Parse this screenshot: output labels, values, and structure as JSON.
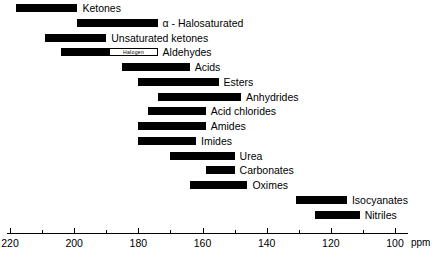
{
  "chart_data": {
    "type": "bar",
    "title": "",
    "xlabel": "ppm",
    "ylabel": "",
    "orientation": "horizontal-range",
    "axis": {
      "unit": "ppm",
      "min": 100,
      "max": 220,
      "reversed": true,
      "major_ticks": [
        220,
        200,
        180,
        160,
        140,
        120,
        100
      ],
      "minor_ticks": [
        210,
        190,
        170,
        150,
        130,
        110
      ],
      "tick_labels": [
        "220",
        "200",
        "180",
        "160",
        "140",
        "120",
        "100"
      ],
      "grid": false
    },
    "legend": "none",
    "categories": [
      "Ketones",
      "α - Halosaturated",
      "Unsaturated ketones",
      "Aldehydes",
      "Acids",
      "Esters",
      "Anhydrides",
      "Acid chlorides",
      "Amides",
      "Imides",
      "Urea",
      "Carbonates",
      "Oximes",
      "Isocyanates",
      "Nitriles"
    ],
    "ranges": [
      {
        "label": "Ketones",
        "start_ppm": 218,
        "end_ppm": 199
      },
      {
        "label": "α - Halosaturated",
        "start_ppm": 199,
        "end_ppm": 174
      },
      {
        "label": "Unsaturated ketones",
        "start_ppm": 209,
        "end_ppm": 190
      },
      {
        "label": "Aldehydes",
        "start_ppm": 204,
        "end_ppm": 174,
        "split_at_ppm": 189,
        "split_label": "Halogen"
      },
      {
        "label": "Acids",
        "start_ppm": 185,
        "end_ppm": 164
      },
      {
        "label": "Esters",
        "start_ppm": 180,
        "end_ppm": 155
      },
      {
        "label": "Anhydrides",
        "start_ppm": 174,
        "end_ppm": 148
      },
      {
        "label": "Acid chlorides",
        "start_ppm": 177,
        "end_ppm": 159
      },
      {
        "label": "Amides",
        "start_ppm": 180,
        "end_ppm": 159
      },
      {
        "label": "Imides",
        "start_ppm": 180,
        "end_ppm": 162
      },
      {
        "label": "Urea",
        "start_ppm": 170,
        "end_ppm": 150
      },
      {
        "label": "Carbonates",
        "start_ppm": 159,
        "end_ppm": 150
      },
      {
        "label": "Oximes",
        "start_ppm": 164,
        "end_ppm": 146
      },
      {
        "label": "Isocyanates",
        "start_ppm": 131,
        "end_ppm": 115
      },
      {
        "label": "Nitriles",
        "start_ppm": 125,
        "end_ppm": 111
      }
    ],
    "bar_color": "#000000",
    "inset_box_color": "#ffffff"
  }
}
